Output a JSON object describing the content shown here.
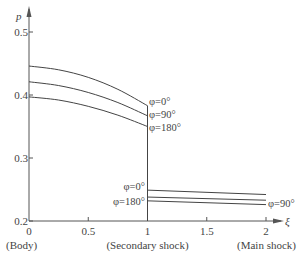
{
  "chart_data": {
    "type": "line",
    "title": "",
    "xlabel": "ξ",
    "ylabel": "p",
    "xlim": [
      0,
      2.1
    ],
    "ylim": [
      0.2,
      0.52
    ],
    "grid": false,
    "x_ticks": [
      0,
      0.5,
      1,
      1.5,
      2
    ],
    "x_tick_labels": [
      "0",
      "0.5",
      "1",
      "1.5",
      "2"
    ],
    "y_ticks": [
      0.2,
      0.3,
      0.4,
      0.5
    ],
    "y_tick_labels": [
      "0.2",
      "0.3",
      "0.4",
      "0.5"
    ],
    "x_annotations": [
      {
        "x": 0,
        "text": "(Body)"
      },
      {
        "x": 1,
        "text": "(Secondary shock)"
      },
      {
        "x": 2,
        "text": "(Main shock)"
      }
    ],
    "series": [
      {
        "name": "φ=0°",
        "segment": "body-to-secondary",
        "x": [
          0,
          0.25,
          0.5,
          0.75,
          1
        ],
        "values": [
          0.446,
          0.44,
          0.428,
          0.409,
          0.383
        ]
      },
      {
        "name": "φ=90°",
        "segment": "body-to-secondary",
        "x": [
          0,
          0.25,
          0.5,
          0.75,
          1
        ],
        "values": [
          0.421,
          0.415,
          0.404,
          0.388,
          0.367
        ]
      },
      {
        "name": "φ=180°",
        "segment": "body-to-secondary",
        "x": [
          0,
          0.25,
          0.5,
          0.75,
          1
        ],
        "values": [
          0.397,
          0.392,
          0.382,
          0.368,
          0.35
        ]
      },
      {
        "name": "φ=0°",
        "segment": "secondary-to-main",
        "x": [
          1,
          2
        ],
        "values": [
          0.249,
          0.242
        ]
      },
      {
        "name": "φ=90°",
        "segment": "secondary-to-main",
        "x": [
          1,
          2
        ],
        "values": [
          0.238,
          0.233
        ]
      },
      {
        "name": "φ=180°",
        "segment": "secondary-to-main",
        "x": [
          1,
          2
        ],
        "values": [
          0.232,
          0.226
        ]
      }
    ],
    "annotations": [
      {
        "text": "φ=0°",
        "at": "end of upper φ=0° curve (ξ=1)"
      },
      {
        "text": "φ=90°",
        "at": "end of upper φ=90° curve (ξ=1)"
      },
      {
        "text": "φ=180°",
        "at": "end of upper φ=180° curve (ξ=1)"
      },
      {
        "text": "φ=0°",
        "at": "start of lower φ=0° curve (ξ=1)"
      },
      {
        "text": "φ=180°",
        "at": "start of lower φ=180° curve (ξ=1)"
      },
      {
        "text": "φ=90°",
        "at": "end of lower φ=90° curve (ξ=2)"
      }
    ],
    "vertical_jump_at_x": 1
  },
  "labels": {
    "ylabel": "p",
    "xlabel": "ξ",
    "upper_phi0": "φ=0°",
    "upper_phi90": "φ=90°",
    "upper_phi180": "φ=180°",
    "lower_phi0": "φ=0°",
    "lower_phi180": "φ=180°",
    "lower_phi90": "φ=90°"
  }
}
